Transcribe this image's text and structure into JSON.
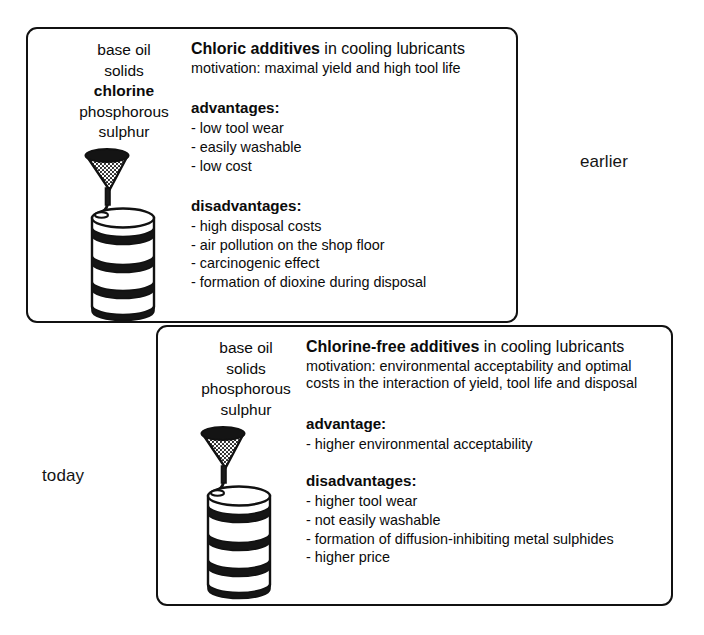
{
  "eras": {
    "earlier_label": "earlier",
    "today_label": "today"
  },
  "earlier": {
    "ingredients": [
      {
        "text": "base oil",
        "bold": false
      },
      {
        "text": "solids",
        "bold": false
      },
      {
        "text": "chlorine",
        "bold": true
      },
      {
        "text": "phosphorous",
        "bold": false
      },
      {
        "text": "sulphur",
        "bold": false
      }
    ],
    "headline_strong": "Chloric additives",
    "headline_rest": " in cooling lubricants",
    "motivation": "motivation: maximal yield and high tool life",
    "advantages_title": "advantages:",
    "advantages": [
      "low tool wear",
      "easily washable",
      "low cost"
    ],
    "disadvantages_title": "disadvantages:",
    "disadvantages": [
      "high disposal costs",
      "air pollution on the shop floor",
      "carcinogenic effect",
      "formation of dioxine during disposal"
    ],
    "illustration": "oil-barrel-with-funnel"
  },
  "today": {
    "ingredients": [
      {
        "text": "base oil",
        "bold": false
      },
      {
        "text": "solids",
        "bold": false
      },
      {
        "text": "phosphorous",
        "bold": false
      },
      {
        "text": "sulphur",
        "bold": false
      }
    ],
    "headline_strong": "Chlorine-free additives",
    "headline_rest": " in cooling lubricants",
    "motivation_line1": "motivation: environmental acceptability and optimal",
    "motivation_line2": "costs in the interaction of yield, tool life and disposal",
    "advantages_title": "advantage:",
    "advantages": [
      "higher environmental acceptability"
    ],
    "disadvantages_title": "disadvantages:",
    "disadvantages": [
      "higher tool wear",
      "not easily washable",
      "formation of diffusion-inhibiting metal sulphides",
      "higher price"
    ],
    "illustration": "oil-barrel-with-funnel"
  },
  "colors": {
    "ink": "#111111",
    "background": "#ffffff"
  }
}
